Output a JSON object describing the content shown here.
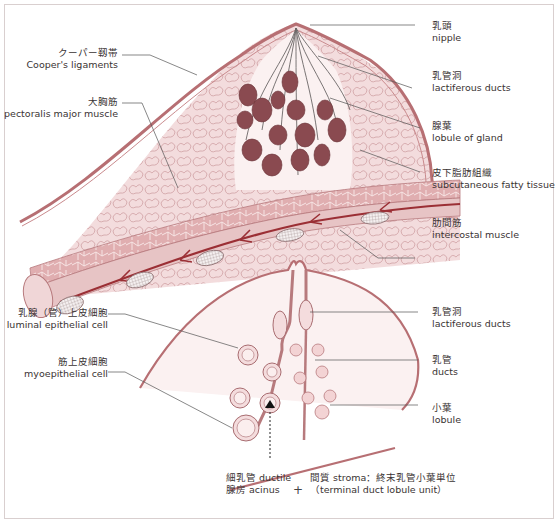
{
  "colors": {
    "skin": "#b76f73",
    "fat_fill": "#f1d9da",
    "fat_line": "#c99a9c",
    "lobule_dark": "#8a4a50",
    "muscle": "#d9a6a7",
    "vessel": "#9b2f35",
    "leader_line": "#555555",
    "text": "#3a3333"
  },
  "top_diagram": {
    "left_labels": [
      {
        "jp": "クーパー靱帯",
        "en": "Cooper's ligaments"
      },
      {
        "jp": "大胸筋",
        "en": "pectoralis major muscle"
      }
    ],
    "right_labels": [
      {
        "jp": "乳頭",
        "en": "nipple"
      },
      {
        "jp": "乳管洞",
        "en": "lactiferous ducts"
      },
      {
        "jp": "腺葉",
        "en": "lobule of gland"
      },
      {
        "jp": "皮下脂肪組織",
        "en": "subcutaneous fatty tissue"
      },
      {
        "jp": "肋間筋",
        "en": "intercostal muscle"
      }
    ]
  },
  "bottom_diagram": {
    "left_labels": [
      {
        "jp": "乳腺（管）上皮細胞",
        "en": "luminal epithelial cell"
      },
      {
        "jp": "筋上皮細胞",
        "en": "myoepithelial cell"
      }
    ],
    "right_labels": [
      {
        "jp": "乳管洞",
        "en": "lactiferous ducts"
      },
      {
        "jp": "乳管",
        "en": "ducts"
      },
      {
        "jp": "小葉",
        "en": "lobule"
      }
    ],
    "caption": {
      "left_line1": "細乳管 ductile",
      "left_line2": "腺房 acinus",
      "plus": "+",
      "right_line1": "間質 stroma：終末乳管小葉単位",
      "right_line2": "（terminal duct lobule unit）"
    }
  }
}
